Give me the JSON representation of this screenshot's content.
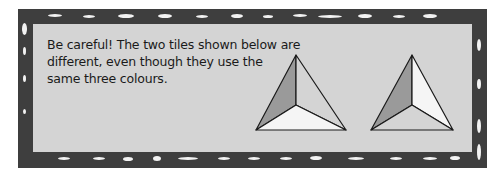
{
  "note": {
    "line1": "Be careful! The two tiles shown below are",
    "line2": "different, even though they use the",
    "line3": "same three colours."
  },
  "colors": {
    "frame": "#3e3e3e",
    "panel": "#d4d4d4",
    "dark_face": "#9a9a9a",
    "light_face": "#f5f5f5",
    "mid_face": "#d4d4d4",
    "outline": "#1a1a1a"
  },
  "tiles": [
    {
      "name": "left-tile",
      "faces": {
        "left": "dark",
        "right": "mid",
        "bottom": "light"
      }
    },
    {
      "name": "right-tile",
      "faces": {
        "left": "dark",
        "right": "light",
        "bottom": "mid"
      }
    }
  ]
}
